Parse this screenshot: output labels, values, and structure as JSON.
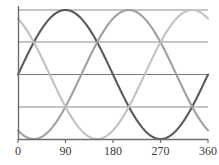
{
  "chart_data": {
    "type": "line",
    "title": "",
    "subtitle": "",
    "xlabel": "",
    "ylabel": "",
    "xlim": [
      0,
      360
    ],
    "ylim": [
      -1,
      1
    ],
    "grid": true,
    "grid_axis": "y",
    "gridline_values": [
      1,
      0.5,
      0,
      -0.5
    ],
    "legend": "none",
    "x_ticks": [
      0,
      90,
      180,
      270,
      360
    ],
    "x_tick_labels": [
      "0",
      "90",
      "180",
      "270",
      "360"
    ],
    "y_ticks": [],
    "y_tick_labels": [],
    "x_unit": "degrees",
    "x": [
      0,
      10,
      20,
      30,
      40,
      50,
      60,
      70,
      80,
      90,
      100,
      110,
      120,
      130,
      140,
      150,
      160,
      170,
      180,
      190,
      200,
      210,
      220,
      230,
      240,
      250,
      260,
      270,
      280,
      290,
      300,
      310,
      320,
      330,
      340,
      350,
      360
    ],
    "series": [
      {
        "name": "phase-a",
        "color": "#5a5a5a",
        "phase_deg": 0,
        "amplitude": 1,
        "values": [
          0,
          0.174,
          0.342,
          0.5,
          0.643,
          0.766,
          0.866,
          0.94,
          0.985,
          1,
          0.985,
          0.94,
          0.866,
          0.766,
          0.643,
          0.5,
          0.342,
          0.174,
          0,
          -0.174,
          -0.342,
          -0.5,
          -0.643,
          -0.766,
          -0.866,
          -0.94,
          -0.985,
          -1,
          -0.985,
          -0.94,
          -0.866,
          -0.766,
          -0.643,
          -0.5,
          -0.342,
          -0.174,
          0
        ]
      },
      {
        "name": "phase-b",
        "color": "#a0a0a0",
        "phase_deg": -120,
        "amplitude": 1,
        "values": [
          -0.866,
          -0.94,
          -0.985,
          -1,
          -0.985,
          -0.94,
          -0.866,
          -0.766,
          -0.643,
          -0.5,
          -0.342,
          -0.174,
          0,
          0.174,
          0.342,
          0.5,
          0.643,
          0.766,
          0.866,
          0.94,
          0.985,
          1,
          0.985,
          0.94,
          0.866,
          0.766,
          0.643,
          0.5,
          0.342,
          0.174,
          0,
          -0.174,
          -0.342,
          -0.5,
          -0.643,
          -0.766,
          -0.866
        ]
      },
      {
        "name": "phase-c",
        "color": "#c2c2c2",
        "phase_deg": 120,
        "amplitude": 1,
        "values": [
          0.866,
          0.766,
          0.643,
          0.5,
          0.342,
          0.174,
          0,
          -0.174,
          -0.342,
          -0.5,
          -0.643,
          -0.766,
          -0.866,
          -0.94,
          -0.985,
          -1,
          -0.985,
          -0.94,
          -0.866,
          -0.766,
          -0.643,
          -0.5,
          -0.342,
          -0.174,
          0,
          0.174,
          0.342,
          0.5,
          0.643,
          0.766,
          0.866,
          0.94,
          0.985,
          1,
          0.985,
          0.94,
          0.866
        ]
      }
    ]
  },
  "axes": {
    "axis_color": "#6e6e6e",
    "grid_color": "#8c8c8c",
    "tick_color": "#6e6e6e",
    "background": "#ffffff"
  },
  "x_axis_labels": {
    "t0": "0",
    "t1": "90",
    "t2": "180",
    "t3": "270",
    "t4": "360"
  }
}
